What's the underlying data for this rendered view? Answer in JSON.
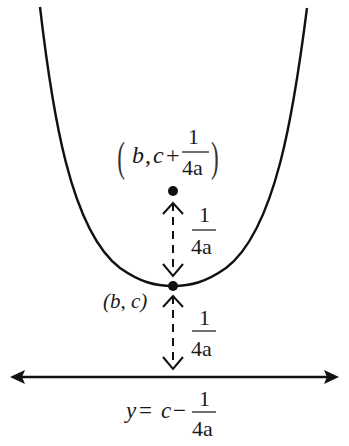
{
  "diagram": {
    "type": "parabola-focus-directrix",
    "colors": {
      "stroke": "#111111",
      "background": "#ffffff"
    },
    "focus_label": {
      "open": "(",
      "b": "b",
      "comma": ",",
      "c": "c",
      "plus": "+",
      "num": "1",
      "den": "4a",
      "close": ")"
    },
    "vertex_label": "(b, c)",
    "upper_distance": {
      "num": "1",
      "den": "4a"
    },
    "lower_distance": {
      "num": "1",
      "den": "4a"
    },
    "directrix_label": {
      "y": "y",
      "eq": "=",
      "c": "c",
      "minus": "−",
      "num": "1",
      "den": "4a"
    }
  }
}
